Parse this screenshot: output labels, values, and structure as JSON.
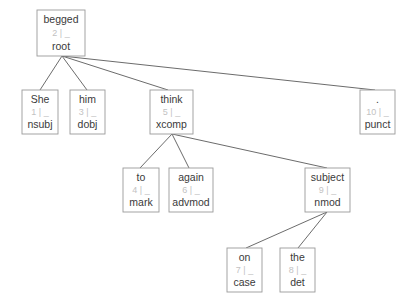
{
  "diagram": {
    "type": "dependency-parse-tree",
    "sentence": "She begged him to think again on the subject .",
    "background_color": "#ffffff",
    "box_border_color": "#9a9a9a",
    "edge_color": "#5a5a5a",
    "word_text_color": "#3a3a3a",
    "meta_text_color": "#c2c2c2",
    "nodes": [
      {
        "id": "begged",
        "word": "begged",
        "meta": "2 | _",
        "index": "2",
        "feature": "_",
        "relation": "root",
        "x": 37,
        "y": 10,
        "w": 48,
        "h": 46
      },
      {
        "id": "she",
        "word": "She",
        "meta": "1 | _",
        "index": "1",
        "feature": "_",
        "relation": "nsubj",
        "x": 22,
        "y": 90,
        "w": 36,
        "h": 44
      },
      {
        "id": "him",
        "word": "him",
        "meta": "3 | _",
        "index": "3",
        "feature": "_",
        "relation": "dobj",
        "x": 70,
        "y": 90,
        "w": 35,
        "h": 44
      },
      {
        "id": "think",
        "word": "think",
        "meta": "5 | _",
        "index": "5",
        "feature": "_",
        "relation": "xcomp",
        "x": 150,
        "y": 90,
        "w": 43,
        "h": 44
      },
      {
        "id": "punct",
        "word": ".",
        "meta": "10 | _",
        "index": "10",
        "feature": "_",
        "relation": "punct",
        "x": 360,
        "y": 90,
        "w": 35,
        "h": 44
      },
      {
        "id": "to",
        "word": "to",
        "meta": "4 | _",
        "index": "4",
        "feature": "_",
        "relation": "mark",
        "x": 123,
        "y": 168,
        "w": 36,
        "h": 44
      },
      {
        "id": "again",
        "word": "again",
        "meta": "6 | _",
        "index": "6",
        "feature": "_",
        "relation": "advmod",
        "x": 169,
        "y": 168,
        "w": 44,
        "h": 44
      },
      {
        "id": "subject",
        "word": "subject",
        "meta": "9 | _",
        "index": "9",
        "feature": "_",
        "relation": "nmod",
        "x": 305,
        "y": 168,
        "w": 45,
        "h": 44
      },
      {
        "id": "on",
        "word": "on",
        "meta": "7 | _",
        "index": "7",
        "feature": "_",
        "relation": "case",
        "x": 227,
        "y": 248,
        "w": 35,
        "h": 44
      },
      {
        "id": "the",
        "word": "the",
        "meta": "8 | _",
        "index": "8",
        "feature": "_",
        "relation": "det",
        "x": 280,
        "y": 248,
        "w": 35,
        "h": 44
      }
    ],
    "edges": [
      {
        "from": "begged",
        "to": "she",
        "x1": 62,
        "y1": 56,
        "x2": 40,
        "y2": 90
      },
      {
        "from": "begged",
        "to": "him",
        "x1": 62,
        "y1": 56,
        "x2": 87,
        "y2": 90
      },
      {
        "from": "begged",
        "to": "think",
        "x1": 62,
        "y1": 56,
        "x2": 168,
        "y2": 90
      },
      {
        "from": "begged",
        "to": "punct",
        "x1": 62,
        "y1": 56,
        "x2": 375,
        "y2": 90
      },
      {
        "from": "think",
        "to": "to",
        "x1": 172,
        "y1": 134,
        "x2": 140,
        "y2": 168
      },
      {
        "from": "think",
        "to": "again",
        "x1": 172,
        "y1": 134,
        "x2": 189,
        "y2": 168
      },
      {
        "from": "think",
        "to": "subject",
        "x1": 172,
        "y1": 134,
        "x2": 327,
        "y2": 168
      },
      {
        "from": "subject",
        "to": "on",
        "x1": 327,
        "y1": 212,
        "x2": 246,
        "y2": 248
      },
      {
        "from": "subject",
        "to": "the",
        "x1": 327,
        "y1": 212,
        "x2": 298,
        "y2": 248
      }
    ]
  }
}
